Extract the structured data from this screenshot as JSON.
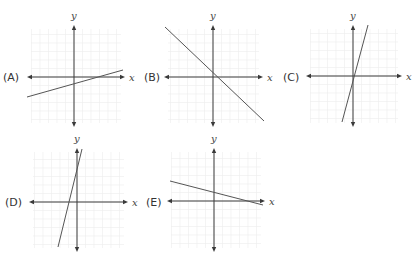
{
  "chart_data": [
    {
      "type": "line",
      "label": "(A)",
      "xlabel": "x",
      "ylabel": "y",
      "grid": true,
      "description": "shallow positive slope, negative y-intercept",
      "origin": [
        74,
        77
      ],
      "line": [
        [
          27,
          97
        ],
        [
          123,
          70
        ]
      ],
      "xaxis": [
        27,
        125
      ],
      "yaxis": [
        25,
        127
      ],
      "label_pos": [
        3,
        81
      ]
    },
    {
      "type": "line",
      "label": "(B)",
      "xlabel": "x",
      "ylabel": "y",
      "grid": true,
      "description": "negative slope near -1, passes near origin",
      "origin": [
        213,
        77
      ],
      "line": [
        [
          165,
          27
        ],
        [
          264,
          121
        ]
      ],
      "xaxis": [
        164,
        263
      ],
      "yaxis": [
        25,
        127
      ],
      "label_pos": [
        144,
        81
      ]
    },
    {
      "type": "line",
      "label": "(C)",
      "xlabel": "x",
      "ylabel": "y",
      "grid": true,
      "description": "steep positive slope, passes near origin",
      "origin": [
        353,
        76
      ],
      "line": [
        [
          342,
          122
        ],
        [
          368,
          25
        ]
      ],
      "xaxis": [
        306,
        402
      ],
      "yaxis": [
        25,
        127
      ],
      "label_pos": [
        283,
        81
      ]
    },
    {
      "type": "line",
      "label": "(D)",
      "xlabel": "x",
      "ylabel": "y",
      "grid": true,
      "description": "steep positive slope, positive y-intercept",
      "origin": [
        77,
        202
      ],
      "line": [
        [
          58,
          247
        ],
        [
          82,
          149
        ]
      ],
      "xaxis": [
        29,
        128
      ],
      "yaxis": [
        148,
        252
      ],
      "label_pos": [
        5,
        206
      ]
    },
    {
      "type": "line",
      "label": "(E)",
      "xlabel": "x",
      "ylabel": "y",
      "grid": true,
      "description": "shallow negative slope, positive y-intercept",
      "origin": [
        214,
        201
      ],
      "line": [
        [
          170,
          181
        ],
        [
          263,
          205
        ]
      ],
      "xaxis": [
        167,
        265
      ],
      "yaxis": [
        148,
        252
      ],
      "label_pos": [
        146,
        206
      ]
    }
  ]
}
